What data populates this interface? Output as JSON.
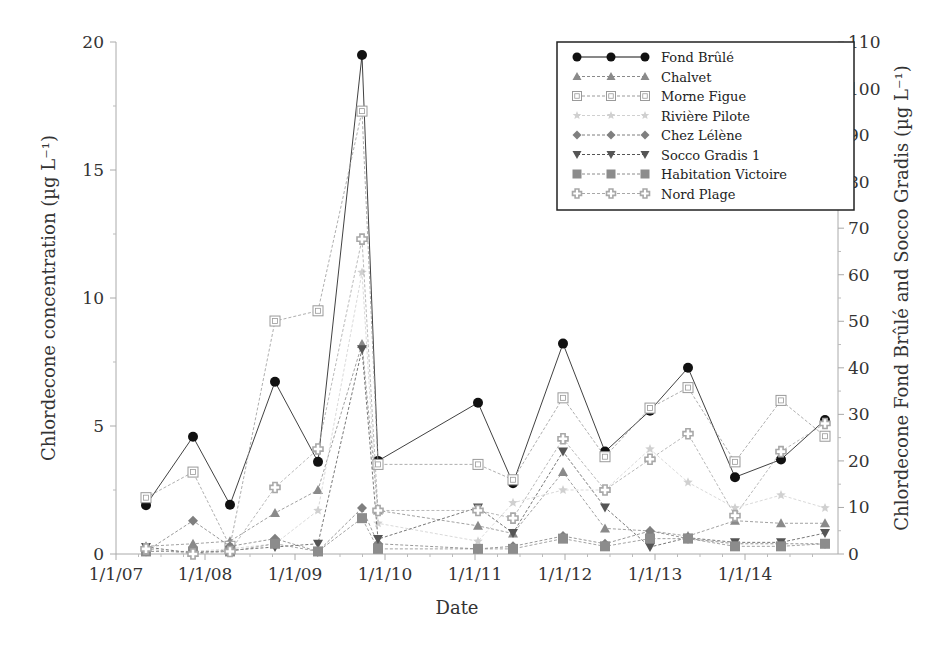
{
  "chart_data": {
    "type": "line",
    "title": "",
    "xlabel": "Date",
    "ylabel": "Chlordecone concentration (µg L⁻¹)",
    "ylabel_right": "Chlordecone Fond Brûlé and Socco Gradis (µg L⁻¹)",
    "ylim": [
      0,
      20
    ],
    "ylim_right": [
      0,
      110
    ],
    "yticks": [
      "0",
      "5",
      "10",
      "15",
      "20"
    ],
    "yticks_right": [
      "0",
      "10",
      "20",
      "30",
      "40",
      "50",
      "60",
      "70",
      "80",
      "90",
      "100",
      "110"
    ],
    "xticks": [
      "1/1/07",
      "1/1/08",
      "1/1/09",
      "1/1/10",
      "1/1/11",
      "1/1/12",
      "1/1/13",
      "1/1/14"
    ],
    "grid": false,
    "legend_position": "upper right",
    "x": [
      "2007-04",
      "2007-12",
      "2008-05",
      "2009-01",
      "2009-07",
      "2009-12",
      "2010-02",
      "2011-01",
      "2011-05",
      "2011-11",
      "2012-05",
      "2012-12",
      "2013-05",
      "2013-11",
      "2014-05",
      "2014-12"
    ],
    "series": [
      {
        "name": "Fond Brûlé",
        "axis": "right",
        "marker": "circle",
        "color": "#111111",
        "values": [
          10.5,
          25.2,
          10.6,
          37.0,
          19.8,
          107.2,
          20.0,
          32.5,
          15.2,
          45.2,
          22.0,
          30.8,
          40.0,
          16.5,
          20.3,
          28.8
        ]
      },
      {
        "name": "Chalvet",
        "axis": "left",
        "marker": "triangle",
        "color": "#8a8a8a",
        "values": [
          0.3,
          0.4,
          0.5,
          1.6,
          2.5,
          8.2,
          1.7,
          1.1,
          0.8,
          3.2,
          1.0,
          0.9,
          0.7,
          1.3,
          1.2,
          1.2
        ]
      },
      {
        "name": "Morne Figue",
        "axis": "left",
        "marker": "square-open",
        "color": "#9a9a9a",
        "values": [
          2.2,
          3.2,
          0.3,
          9.1,
          9.5,
          17.3,
          3.5,
          3.5,
          2.9,
          6.1,
          3.8,
          5.7,
          6.5,
          3.6,
          6.0,
          4.6
        ]
      },
      {
        "name": "Rivière Pilote",
        "axis": "left",
        "marker": "star",
        "color": "#d0d0d0",
        "values": [
          0.1,
          0.1,
          0.2,
          0.4,
          1.7,
          11.0,
          1.2,
          0.5,
          2.0,
          2.5,
          2.5,
          4.1,
          2.8,
          1.8,
          2.3,
          1.8
        ]
      },
      {
        "name": "Chez Lélène",
        "axis": "left",
        "marker": "diamond",
        "color": "#7f7f7f",
        "values": [
          0.1,
          1.3,
          0.3,
          0.6,
          0.1,
          1.8,
          0.4,
          0.2,
          0.3,
          0.7,
          0.4,
          0.9,
          0.6,
          0.4,
          0.4,
          0.4
        ]
      },
      {
        "name": "Socco Gradis 1",
        "axis": "right",
        "marker": "triangle-down",
        "color": "#555555",
        "values": [
          1.5,
          0.2,
          0.8,
          1.5,
          2.2,
          44.0,
          3.2,
          10.0,
          4.5,
          22.0,
          10.0,
          1.5,
          3.5,
          2.5,
          2.5,
          4.5
        ]
      },
      {
        "name": "Habitation Victoire",
        "axis": "left",
        "marker": "square",
        "color": "#8c8c8c",
        "values": [
          0.1,
          0.1,
          0.1,
          0.4,
          0.1,
          1.4,
          0.2,
          0.2,
          0.2,
          0.6,
          0.3,
          0.6,
          0.6,
          0.3,
          0.3,
          0.4
        ]
      },
      {
        "name": "Nord Plage",
        "axis": "left",
        "marker": "cross",
        "color": "#a8a8a8",
        "values": [
          0.2,
          0.0,
          0.1,
          2.6,
          4.1,
          12.3,
          1.7,
          1.7,
          1.4,
          4.5,
          2.5,
          3.7,
          4.7,
          1.5,
          4.0,
          5.1
        ]
      }
    ]
  },
  "legend": {
    "items": [
      {
        "label": "Fond Brûlé"
      },
      {
        "label": "Chalvet"
      },
      {
        "label": "Morne Figue"
      },
      {
        "label": "Rivière Pilote"
      },
      {
        "label": "Chez Lélène"
      },
      {
        "label": "Socco Gradis 1"
      },
      {
        "label": "Habitation Victoire"
      },
      {
        "label": "Nord Plage"
      }
    ]
  }
}
